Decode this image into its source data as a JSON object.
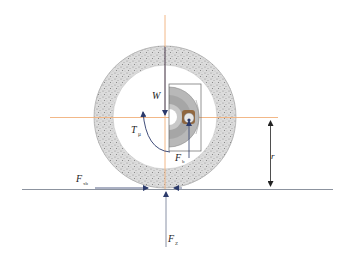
{
  "diagram": {
    "colors": {
      "background": "#ffffff",
      "tire_fill": "#d8d8d8",
      "tire_speckle": "#8a8a8a",
      "centerline": "#f0b07a",
      "force_arrow": "#2b3a6b",
      "ground_line": "#7f8794",
      "dimension_line": "#333333",
      "hub_gray": "#a9a9a9",
      "hub_bearing": "#8b5a2b"
    },
    "labels": {
      "weight": {
        "main": "W",
        "sub": ""
      },
      "torque": {
        "main": "T",
        "sub": "μ"
      },
      "bearing_force": {
        "main": "F",
        "sub": "b"
      },
      "braking_force": {
        "main": "F",
        "sub": "xb"
      },
      "normal_force": {
        "main": "F",
        "sub": "Z"
      },
      "radius": {
        "main": "r",
        "sub": ""
      }
    }
  }
}
